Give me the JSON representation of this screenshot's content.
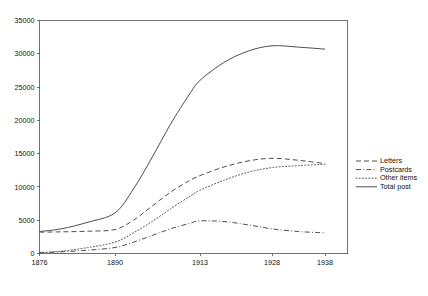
{
  "chart_data": {
    "type": "line",
    "title": "",
    "subtitle": "",
    "xlabel": "",
    "ylabel": "",
    "xlim": [
      1876,
      1938
    ],
    "ylim": [
      0,
      35000
    ],
    "grid": false,
    "legend_position": "right",
    "x_tick_labels": [
      "1876",
      "1890",
      "1913",
      "1928",
      "1938"
    ],
    "x_tick_values": [
      1876,
      1890,
      1913,
      1928,
      1938
    ],
    "y_tick_labels": [
      "0",
      "5000",
      "10000",
      "15000",
      "20000",
      "25000",
      "30000",
      "35000"
    ],
    "y_tick_values": [
      0,
      5000,
      10000,
      15000,
      20000,
      25000,
      30000,
      35000
    ],
    "x": [
      1876,
      1880,
      1885,
      1890,
      1895,
      1900,
      1905,
      1910,
      1913,
      1918,
      1923,
      1928,
      1933,
      1938
    ],
    "series": [
      {
        "name": "Letters",
        "style": "dashed",
        "values": [
          3200,
          3250,
          3350,
          3600,
          5000,
          7100,
          9200,
          10900,
          11700,
          13000,
          13900,
          14300,
          14000,
          13500
        ]
      },
      {
        "name": "Postcards",
        "style": "dash-dot",
        "values": [
          150,
          250,
          500,
          900,
          1700,
          2700,
          3700,
          4500,
          4900,
          4800,
          4300,
          3700,
          3300,
          3100
        ]
      },
      {
        "name": "Other items",
        "style": "dotted",
        "values": [
          120,
          350,
          900,
          1700,
          3100,
          4800,
          6700,
          8500,
          9500,
          11000,
          12200,
          12900,
          13200,
          13400
        ]
      },
      {
        "name": "Total post",
        "style": "solid",
        "values": [
          3300,
          3700,
          4700,
          6100,
          9700,
          14400,
          19400,
          23800,
          26000,
          28700,
          30400,
          31200,
          31000,
          30700
        ]
      }
    ]
  },
  "legend": {
    "items": [
      {
        "label": "Letters"
      },
      {
        "label": "Postcards"
      },
      {
        "label": "Other items"
      },
      {
        "label": "Total post"
      }
    ]
  },
  "colors": {
    "line": "#3a3a3a",
    "axis": "#4d4d4d",
    "text": "#111111",
    "background": "#ffffff"
  }
}
